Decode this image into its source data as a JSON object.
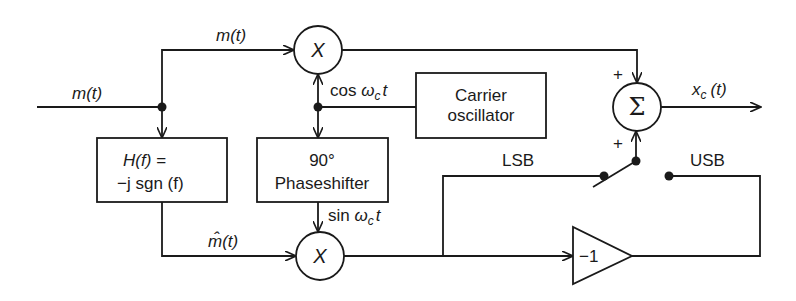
{
  "diagram": {
    "input_label": "m(t)",
    "top_path_label": "m(t)",
    "hilbert_path_label": "m̂(t)",
    "output_label": "x_c (t)",
    "output_label_main": "x",
    "output_label_sub": "c",
    "output_label_arg": "(t)",
    "blocks": {
      "hilbert": {
        "line1": "H(f) =",
        "line2": "−j sgn (f)"
      },
      "phase_shifter": {
        "line1": "90°",
        "line2": "Phaseshifter"
      },
      "carrier": {
        "line1": "Carrier",
        "line2": "oscillator"
      },
      "inverter": {
        "label": "−1"
      }
    },
    "multipliers": {
      "top": "X",
      "bottom": "X"
    },
    "summer": {
      "symbol": "Σ",
      "top_sign": "+",
      "bottom_sign": "+"
    },
    "signals": {
      "cos": {
        "prefix": "cos ",
        "omega": "ω",
        "sub": "c",
        "suffix": "t"
      },
      "sin": {
        "prefix": "sin ",
        "omega": "ω",
        "sub": "c",
        "suffix": "t"
      }
    },
    "switch": {
      "lsb_label": "LSB",
      "usb_label": "USB"
    }
  }
}
